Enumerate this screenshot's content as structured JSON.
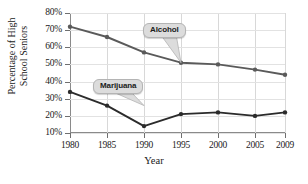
{
  "chart_data": {
    "type": "line",
    "title": "",
    "xlabel": "Year",
    "ylabel": "Percentage of High School Seniors",
    "ylabel_line1": "Percentage of High",
    "ylabel_line2": "School Seniors",
    "x": [
      1980,
      1985,
      1990,
      1995,
      2000,
      2005,
      2009
    ],
    "categories": [
      "1980",
      "1985",
      "1990",
      "1995",
      "2000",
      "2005",
      "2009"
    ],
    "yticks": [
      10,
      20,
      30,
      40,
      50,
      60,
      70,
      80
    ],
    "ytick_labels": [
      "10%",
      "20%",
      "30%",
      "40%",
      "50%",
      "60%",
      "70%",
      "80%"
    ],
    "ylim": [
      5,
      80
    ],
    "xlim": [
      1980,
      2009
    ],
    "grid": true,
    "legend_position": "inline-callouts",
    "series": [
      {
        "name": "Alcohol",
        "color": "#5a5a5a",
        "values": [
          72,
          66,
          57,
          51,
          50,
          47,
          44
        ],
        "label": "Alcohol"
      },
      {
        "name": "Marijuana",
        "color": "#2b2b2b",
        "values": [
          34,
          26,
          14,
          21,
          22,
          20,
          22
        ],
        "label": "Marijuana"
      }
    ],
    "annotations": [
      {
        "text": "Alcohol",
        "points_to_year": 1995,
        "points_to_value": 51
      },
      {
        "text": "Marijuana",
        "points_to_year": 1990,
        "points_to_value": 26
      }
    ]
  },
  "colors": {
    "alcohol_line": "#5a5a5a",
    "marijuana_line": "#2b2b2b",
    "axis": "#8a8a8a",
    "grid": "#dedede",
    "callout_bg": "#dcdcdc",
    "text": "#1a1a1a"
  }
}
